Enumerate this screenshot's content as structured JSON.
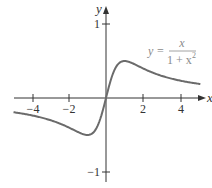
{
  "chart_data": {
    "type": "line",
    "title": "",
    "function": "y = x / (1 + x^2)",
    "annotation": {
      "lhs": "y =",
      "numerator": "x",
      "denominator": "1 + x",
      "exponent": "2"
    },
    "xlabel": "x",
    "ylabel": "y",
    "xlim": [
      -5.6,
      5.3
    ],
    "ylim": [
      -1.2,
      1.3
    ],
    "x_ticks": [
      -4,
      -2,
      2,
      4
    ],
    "x_tick_labels": [
      "−4",
      "−2",
      "2",
      "4"
    ],
    "y_ticks": [
      1,
      -1
    ],
    "y_tick_labels": [
      "1",
      "−1"
    ],
    "grid": false,
    "series": [
      {
        "name": "y = x/(1+x^2)",
        "x": [
          -5,
          -4,
          -3,
          -2,
          -1.5,
          -1,
          -0.5,
          0,
          0.5,
          1,
          1.5,
          2,
          3,
          4,
          5
        ],
        "y": [
          -0.192,
          -0.235,
          -0.3,
          -0.4,
          -0.462,
          -0.5,
          -0.4,
          0,
          0.4,
          0.5,
          0.462,
          0.4,
          0.3,
          0.235,
          0.192
        ],
        "color": "#6b6b6b"
      }
    ],
    "axis_color": "#333333"
  }
}
